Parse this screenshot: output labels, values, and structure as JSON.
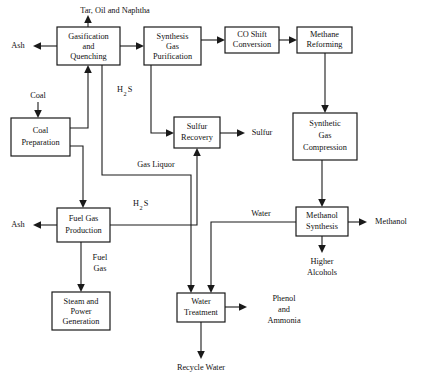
{
  "diagram": {
    "type": "process-flow-diagram",
    "background_color": "#ffffff",
    "line_color": "#1a1a1a",
    "text_color": "#111111",
    "nodes": [
      {
        "id": "gasification",
        "label_lines": [
          "Gasification",
          "and",
          "Quenching"
        ],
        "x": 57,
        "y": 27,
        "w": 63,
        "h": 38
      },
      {
        "id": "syngas_purification",
        "label_lines": [
          "Synthesis",
          "Gas",
          "Purification"
        ],
        "x": 144,
        "y": 27,
        "w": 57,
        "h": 38
      },
      {
        "id": "co_shift",
        "label_lines": [
          "CO Shift",
          "Conversion"
        ],
        "x": 225,
        "y": 27,
        "w": 54,
        "h": 26
      },
      {
        "id": "methane_reforming",
        "label_lines": [
          "Methane",
          "Reforming"
        ],
        "x": 297,
        "y": 27,
        "w": 55,
        "h": 26
      },
      {
        "id": "coal_preparation",
        "label_lines": [
          "Coal",
          "Preparation"
        ],
        "x": 11,
        "y": 118,
        "w": 59,
        "h": 38
      },
      {
        "id": "sulfur_recovery",
        "label_lines": [
          "Sulfur",
          "Recovery"
        ],
        "x": 174,
        "y": 117,
        "w": 46,
        "h": 31
      },
      {
        "id": "syngas_compression",
        "label_lines": [
          "Synthetic",
          "Gas",
          "Compression"
        ],
        "x": 293,
        "y": 113,
        "w": 64,
        "h": 47
      },
      {
        "id": "fuel_gas_production",
        "label_lines": [
          "Fuel Gas",
          "Production"
        ],
        "x": 57,
        "y": 208,
        "w": 53,
        "h": 34
      },
      {
        "id": "methanol_synthesis",
        "label_lines": [
          "Methanol",
          "Synthesis"
        ],
        "x": 296,
        "y": 207,
        "w": 52,
        "h": 29
      },
      {
        "id": "steam_power",
        "label_lines": [
          "Steam and",
          "Power",
          "Generation"
        ],
        "x": 52,
        "y": 292,
        "w": 58,
        "h": 38
      },
      {
        "id": "water_treatment",
        "label_lines": [
          "Water",
          "Treatment"
        ],
        "x": 177,
        "y": 293,
        "w": 48,
        "h": 29
      }
    ],
    "stream_labels": [
      {
        "id": "tar-oil-naphtha",
        "text": "Tar, Oil and Naphtha",
        "x": 115,
        "y": 11
      },
      {
        "id": "ash-top",
        "text": "Ash",
        "x": 18,
        "y": 46
      },
      {
        "id": "coal-feed",
        "text": "Coal",
        "x": 38,
        "y": 96
      },
      {
        "id": "h2s-upper",
        "text": "H",
        "sub": "2",
        "text2": "S",
        "x": 123,
        "y": 91
      },
      {
        "id": "sulfur-product",
        "text": "Sulfur",
        "x": 262,
        "y": 132
      },
      {
        "id": "gas-liquor",
        "text": "Gas Liquor",
        "x": 156,
        "y": 164
      },
      {
        "id": "h2s-lower",
        "text": "H",
        "sub": "2",
        "text2": "S",
        "x": 139,
        "y": 205
      },
      {
        "id": "ash-bottom",
        "text": "Ash",
        "x": 18,
        "y": 224
      },
      {
        "id": "water",
        "text": "Water",
        "x": 261,
        "y": 213
      },
      {
        "id": "methanol-product",
        "text": "Methanol",
        "x": 389,
        "y": 221
      },
      {
        "id": "fuel-gas",
        "text_lines": [
          "Fuel",
          "Gas"
        ],
        "x": 100,
        "y": 262
      },
      {
        "id": "higher-alcohols",
        "text_lines": [
          "Higher",
          "Alcohols"
        ],
        "x": 322,
        "y": 262
      },
      {
        "id": "phenol-ammonia",
        "text_lines": [
          "Phenol",
          "and",
          "Ammonia"
        ],
        "x": 284,
        "y": 300
      },
      {
        "id": "recycle-water",
        "text": "Recycle Water",
        "x": 201,
        "y": 367
      }
    ]
  }
}
